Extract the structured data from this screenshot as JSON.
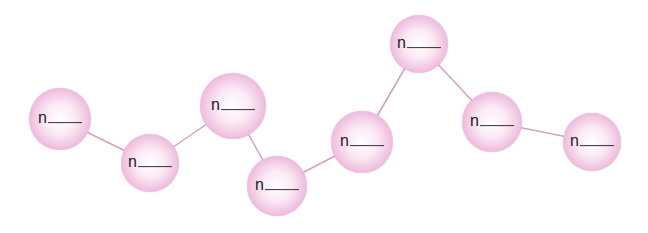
{
  "diagram": {
    "colors": {
      "sphere_fill": "#f0c2e0",
      "sphere_edge": "#d98cc0",
      "connector": "#d4a0c0",
      "text": "#222222"
    },
    "nodes": [
      {
        "label": "n",
        "blank": "____",
        "cx": 60,
        "cy": 119,
        "r": 31
      },
      {
        "label": "n",
        "blank": "____",
        "cx": 150,
        "cy": 163,
        "r": 29
      },
      {
        "label": "n",
        "blank": "____",
        "cx": 233,
        "cy": 106,
        "r": 33
      },
      {
        "label": "n",
        "blank": "____",
        "cx": 277,
        "cy": 186,
        "r": 30
      },
      {
        "label": "n",
        "blank": "____",
        "cx": 362,
        "cy": 142,
        "r": 31
      },
      {
        "label": "n",
        "blank": "____",
        "cx": 419,
        "cy": 44,
        "r": 29
      },
      {
        "label": "n",
        "blank": "____",
        "cx": 492,
        "cy": 122,
        "r": 30
      },
      {
        "label": "n",
        "blank": "____",
        "cx": 592,
        "cy": 142,
        "r": 29
      }
    ],
    "edges": [
      [
        0,
        1
      ],
      [
        1,
        2
      ],
      [
        2,
        3
      ],
      [
        3,
        4
      ],
      [
        4,
        5
      ],
      [
        5,
        6
      ],
      [
        6,
        7
      ]
    ]
  }
}
